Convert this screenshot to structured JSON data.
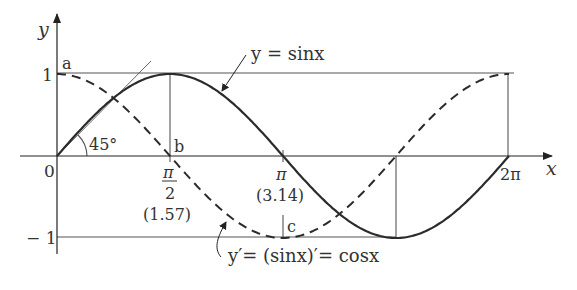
{
  "figure": {
    "type": "sine-cosine-derivative-diagram",
    "axes": {
      "x_label": "x",
      "y_label": "y",
      "origin_label": "0",
      "y_ticks": [
        {
          "value": 1,
          "label": "1"
        },
        {
          "value": -1,
          "label": "− 1"
        }
      ],
      "x_ticks": [
        {
          "value": "pi/2",
          "numerator": "π",
          "denominator": "2",
          "approx": "(1.57)"
        },
        {
          "value": "pi",
          "label": "π",
          "approx": "(3.14)"
        },
        {
          "value": "2pi",
          "label": "2π"
        }
      ]
    },
    "curves": [
      {
        "name": "sin",
        "label": "y = sinx",
        "style": "solid"
      },
      {
        "name": "cos",
        "label": "y′= (sinx)′= cosx",
        "style": "dashed"
      }
    ],
    "annotations": {
      "point_a": "a",
      "point_b": "b",
      "point_c": "c",
      "angle": "45°"
    },
    "colors": {
      "curve": "#2b2b2b",
      "guide": "#555555",
      "text": "#333333",
      "background": "#ffffff"
    }
  }
}
